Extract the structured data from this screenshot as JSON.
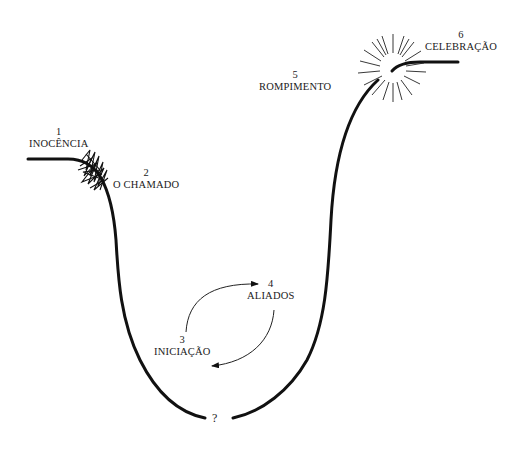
{
  "diagram": {
    "type": "hero-journey-curve",
    "colors": {
      "line": "#111111",
      "background": "#ffffff"
    },
    "stages": [
      {
        "number": "1",
        "name": "INOCÊNCIA"
      },
      {
        "number": "2",
        "name": "O CHAMADO"
      },
      {
        "number": "3",
        "name": "INICIAÇÃO"
      },
      {
        "number": "4",
        "name": "ALIADOS"
      },
      {
        "number": "5",
        "name": "ROMPIMENTO"
      },
      {
        "number": "6",
        "name": "CELEBRAÇÃO"
      }
    ],
    "bottom_marker": "?",
    "symbols": {
      "call": "scribble-icon",
      "breakthrough": "starburst-icon",
      "cycle": "circular-arrows-icon"
    }
  }
}
